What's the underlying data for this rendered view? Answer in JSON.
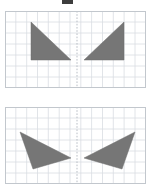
{
  "figure": {
    "title_mark": "",
    "background_color": "#ffffff",
    "shape_color": "#767676",
    "grid_color": "#d9dde2",
    "grid_border_color": "#c2c7cd",
    "axis_color": "#b9bec5",
    "panel_count": 2,
    "shapes_per_panel": 2
  },
  "top_mark": {
    "name": "top-edge-mark",
    "color": "#3d3d3d",
    "x": 62,
    "y": 0,
    "width": 11,
    "height": 4
  },
  "panels": [
    {
      "id": "panel-top",
      "label": "Top grid panel",
      "x": 5,
      "y": 11,
      "width": 141,
      "height": 77,
      "grid": {
        "cell_size": 10.8,
        "columns": 13,
        "rows": 7,
        "show_grid": true
      },
      "axis": {
        "type": "vertical-dashed",
        "x": 72.0,
        "label": "line of reflection"
      },
      "shapes": [
        {
          "name": "left-right-triangle",
          "type": "triangle",
          "orientation": "right-angle-top-left",
          "points": "26,11 26,49 66,49",
          "fill": "#767676"
        },
        {
          "name": "right-right-triangle",
          "type": "triangle",
          "orientation": "right-angle-top-right",
          "points": "119,11 119,49 79,49",
          "fill": "#767676"
        }
      ]
    },
    {
      "id": "panel-bottom",
      "label": "Bottom grid panel",
      "x": 5,
      "y": 107,
      "width": 141,
      "height": 77,
      "grid": {
        "cell_size": 10.8,
        "columns": 13,
        "rows": 7,
        "show_grid": true
      },
      "axis": {
        "type": "vertical-dashed",
        "x": 72.0,
        "label": "line of reflection"
      },
      "shapes": [
        {
          "name": "left-scalene-triangle",
          "type": "triangle",
          "orientation": "pointing-right",
          "points": "15,25 66,51 28,62",
          "fill": "#767676"
        },
        {
          "name": "right-scalene-triangle",
          "type": "triangle",
          "orientation": "pointing-left",
          "points": "130,25 79,51 117,62",
          "fill": "#767676"
        }
      ]
    }
  ]
}
